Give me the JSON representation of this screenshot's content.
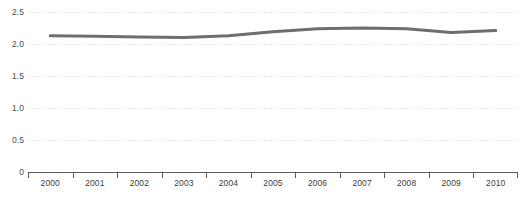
{
  "chart_data": {
    "type": "line",
    "title": "",
    "subtitle": "",
    "xlabel": "",
    "ylabel": "",
    "categories": [
      "2000",
      "2001",
      "2002",
      "2003",
      "2004",
      "2005",
      "2006",
      "2007",
      "2008",
      "2009",
      "2010"
    ],
    "values": [
      2.13,
      2.12,
      2.11,
      2.1,
      2.13,
      2.19,
      2.24,
      2.25,
      2.24,
      2.18,
      2.21
    ],
    "series": [
      {
        "name": "",
        "values": [
          2.13,
          2.12,
          2.11,
          2.1,
          2.13,
          2.19,
          2.24,
          2.25,
          2.24,
          2.18,
          2.21
        ],
        "color": "#6e6e6e"
      }
    ],
    "ylim": [
      0,
      2.5
    ],
    "y_ticks": [
      0,
      0.5,
      1.0,
      1.5,
      2.0,
      2.5
    ],
    "y_tick_labels": [
      "0",
      "0.5",
      "1.0",
      "1.5",
      "2.0",
      "2.5"
    ],
    "grid": true,
    "grid_axis": "y",
    "grid_style": "dashed",
    "grid_color": "#e8e8e8",
    "legend": false,
    "legend_position": "none",
    "axis_color": "#5a5a5a",
    "line_width": 3,
    "markers": false
  }
}
